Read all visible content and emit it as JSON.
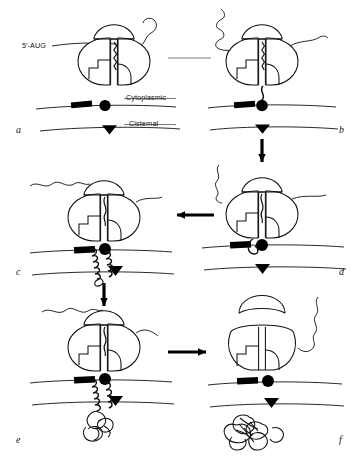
{
  "figure": {
    "type": "diagram",
    "width": 362,
    "height": 463,
    "background": "#ffffff",
    "ink": "#000000",
    "faded_ink": "#9a9a9a"
  },
  "labels": {
    "mrna_start": "5'-AUG",
    "cytoplasmic": "Cytoplasmic",
    "cisternal": "Cisternal"
  },
  "panels": [
    {
      "id": "a",
      "letter": "a",
      "caption": "Ribosome engages mRNA; signal sequence emerging",
      "letter_x": 16,
      "letter_y": 130
    },
    {
      "id": "b",
      "letter": "b",
      "caption": "Ribosome docks on the translocon at the membrane",
      "letter_x": 339,
      "letter_y": 130
    },
    {
      "id": "c",
      "letter": "c",
      "caption": "Nascent chain threads into the translocation channel",
      "letter_x": 16,
      "letter_y": 272
    },
    {
      "id": "d",
      "letter": "d",
      "caption": "Signal sequence inserted, channel opened",
      "letter_x": 339,
      "letter_y": 272
    },
    {
      "id": "e",
      "letter": "e",
      "caption": "Chain elongates and begins folding in the cisternal space",
      "letter_x": 16,
      "letter_y": 440
    },
    {
      "id": "f",
      "letter": "f",
      "caption": "Ribosome dissociates; folded protein released into the lumen",
      "letter_x": 339,
      "letter_y": 440
    }
  ],
  "arrows": [
    {
      "name": "a-to-b",
      "direction": "right",
      "faded": true,
      "x1": 168,
      "y1": 58,
      "x2": 212,
      "y2": 58
    },
    {
      "name": "b-to-d",
      "direction": "down",
      "faded": false,
      "x1": 262,
      "y1": 139,
      "x2": 262,
      "y2": 170
    },
    {
      "name": "d-to-c",
      "direction": "left",
      "faded": false,
      "x1": 214,
      "y1": 215,
      "x2": 168,
      "y2": 215
    },
    {
      "name": "c-to-e",
      "direction": "down",
      "faded": false,
      "x1": 104,
      "y1": 283,
      "x2": 104,
      "y2": 314
    },
    {
      "name": "e-to-f",
      "direction": "right",
      "faded": false,
      "x1": 168,
      "y1": 352,
      "x2": 214,
      "y2": 352
    }
  ],
  "legend_elements": [
    {
      "name": "ribosome-small-subunit",
      "shape": "cap"
    },
    {
      "name": "ribosome-large-subunit",
      "shape": "two-lobed body with notched channel"
    },
    {
      "name": "mrna-strand",
      "shape": "wavy line"
    },
    {
      "name": "nascent-polypeptide",
      "shape": "wavy / helical line"
    },
    {
      "name": "signal-peptidase",
      "shape": "black bar"
    },
    {
      "name": "translocon-pore",
      "shape": "black filled circle"
    },
    {
      "name": "oligosaccharyl-marker",
      "shape": "black filled triangle"
    },
    {
      "name": "folded-protein",
      "shape": "tangled globule"
    },
    {
      "name": "membrane-leaflet",
      "shape": "horizontal line"
    }
  ]
}
